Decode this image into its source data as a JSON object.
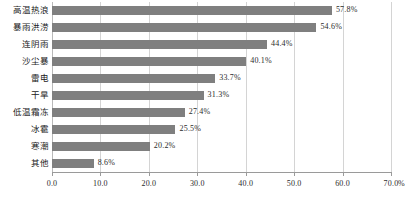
{
  "chart_data": {
    "type": "bar",
    "orientation": "horizontal",
    "title": "",
    "subtitle": "",
    "xlabel": "",
    "ylabel": "",
    "unit": "%",
    "xlim": [
      0,
      70
    ],
    "xtick_step": 10,
    "grid": "vertical",
    "legend": "none",
    "bar_color": "#7f7f7f",
    "gridline_color": "#d4d4d4",
    "axis_color": "#9a9a9a",
    "categories": [
      "高温热浪",
      "暴雨洪涝",
      "连阴雨",
      "沙尘暴",
      "雷电",
      "干旱",
      "低温霜冻",
      "冰雹",
      "寒潮",
      "其他"
    ],
    "values": [
      57.8,
      54.6,
      44.4,
      40.1,
      33.7,
      31.3,
      27.4,
      25.5,
      20.2,
      8.6
    ],
    "value_labels": [
      "57.8%",
      "54.6%",
      "44.4%",
      "40.1%",
      "33.7%",
      "31.3%",
      "27.4%",
      "25.5%",
      "20.2%",
      "8.6%"
    ],
    "xticks": [
      0,
      10,
      20,
      30,
      40,
      50,
      60,
      70
    ],
    "xtick_labels": [
      "0.0",
      "10.0",
      "20.0",
      "30.0",
      "40.0",
      "50.0",
      "60.0",
      "70.0"
    ]
  }
}
